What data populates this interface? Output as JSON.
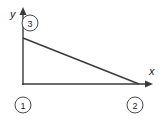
{
  "figure": {
    "type": "geometry-diagram",
    "title": "",
    "background_color": "#ffffff",
    "line_color": "#3a3a3a",
    "label_color": "#1c1c1c"
  },
  "axes": {
    "y_axis": {
      "label": "y",
      "arrow": "up",
      "x": 23,
      "y_top": 9,
      "y_bottom": 85
    },
    "x_axis": {
      "label": "x",
      "arrow": "right",
      "y": 84,
      "x_left": 22,
      "x_right": 152
    }
  },
  "shape": {
    "name": "right-triangle",
    "vertices": [
      {
        "id": "origin",
        "x": 23,
        "y": 84
      },
      {
        "id": "y-intercept",
        "x": 23,
        "y": 38
      },
      {
        "id": "x-intercept",
        "x": 138,
        "y": 84
      }
    ],
    "hypotenuse": {
      "from_x": 23,
      "from_y": 38,
      "to_x": 138,
      "to_y": 84
    }
  },
  "labels": {
    "axis_y": "y",
    "axis_x": "x",
    "nodes": [
      {
        "id": "node-1",
        "text": "1",
        "cx": 23,
        "cy": 105,
        "r": 8
      },
      {
        "id": "node-2",
        "text": "2",
        "cx": 135,
        "cy": 105,
        "r": 8
      },
      {
        "id": "node-3",
        "text": "3",
        "cx": 30,
        "cy": 23,
        "r": 8
      }
    ]
  }
}
